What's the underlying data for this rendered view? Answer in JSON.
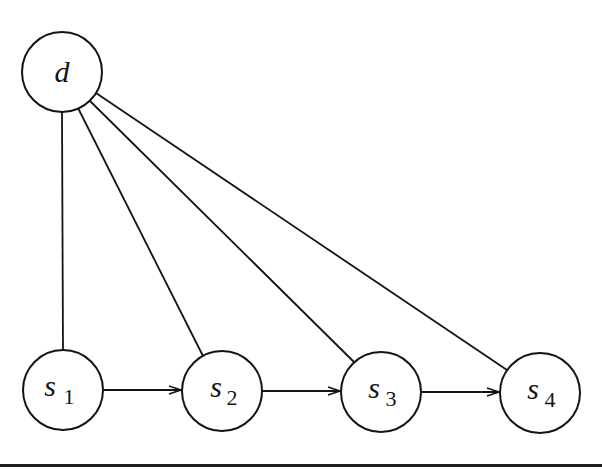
{
  "diagram": {
    "type": "directed-graph",
    "nodes": [
      {
        "id": "d",
        "label": "d",
        "subscript": ""
      },
      {
        "id": "s1",
        "label": "s",
        "subscript": "1"
      },
      {
        "id": "s2",
        "label": "s",
        "subscript": "2"
      },
      {
        "id": "s3",
        "label": "s",
        "subscript": "3"
      },
      {
        "id": "s4",
        "label": "s",
        "subscript": "4"
      }
    ],
    "edges": [
      {
        "from": "d",
        "to": "s1",
        "arrow": false
      },
      {
        "from": "d",
        "to": "s2",
        "arrow": false
      },
      {
        "from": "d",
        "to": "s3",
        "arrow": false
      },
      {
        "from": "d",
        "to": "s4",
        "arrow": false
      },
      {
        "from": "s1",
        "to": "s2",
        "arrow": true
      },
      {
        "from": "s2",
        "to": "s3",
        "arrow": true
      },
      {
        "from": "s3",
        "to": "s4",
        "arrow": true
      }
    ],
    "colors": {
      "stroke": "#141414",
      "background": "#ffffff"
    }
  }
}
